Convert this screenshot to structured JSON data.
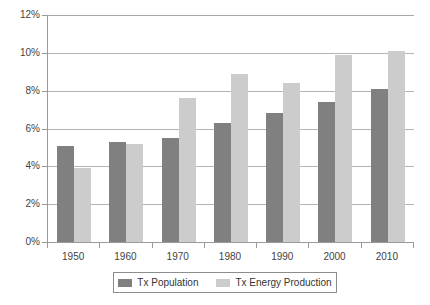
{
  "chart_data": {
    "type": "bar",
    "title": "",
    "subtitle": "",
    "xlabel": "",
    "ylabel": "",
    "categories": [
      "1950",
      "1960",
      "1970",
      "1980",
      "1990",
      "2000",
      "2010"
    ],
    "series": [
      {
        "name": "Tx Population",
        "color": "#808080",
        "values": [
          5.1,
          5.3,
          5.5,
          6.3,
          6.8,
          7.4,
          8.1
        ]
      },
      {
        "name": "Tx Energy Production",
        "color": "#cccccc",
        "values": [
          3.9,
          5.2,
          7.6,
          8.9,
          8.4,
          9.9,
          10.1
        ]
      }
    ],
    "ylim": [
      0,
      12
    ],
    "y_ticks": [
      "0%",
      "2%",
      "4%",
      "6%",
      "8%",
      "10%",
      "12%"
    ],
    "y_tick_values": [
      0,
      2,
      4,
      6,
      8,
      10,
      12
    ],
    "grid": true,
    "legend_position": "bottom",
    "value_unit": "%"
  }
}
